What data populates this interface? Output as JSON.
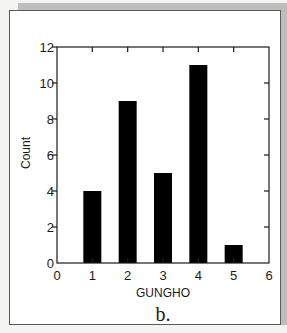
{
  "chart_data": {
    "type": "bar",
    "title": "",
    "caption": "b.",
    "xlabel": "GUNGHO",
    "ylabel": "Count",
    "categories": [
      1,
      2,
      3,
      4,
      5
    ],
    "values": [
      4,
      9,
      5,
      11,
      1
    ],
    "xlim": [
      0,
      6
    ],
    "ylim": [
      0,
      12
    ],
    "xticks": [
      0,
      1,
      2,
      3,
      4,
      5,
      6
    ],
    "yticks": [
      0,
      2,
      4,
      6,
      8,
      10,
      12
    ],
    "grid": false,
    "legend": null,
    "bar_color": "#000000"
  }
}
